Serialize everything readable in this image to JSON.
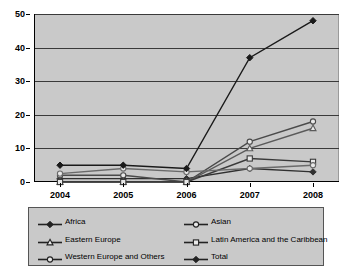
{
  "chart_data": {
    "type": "line",
    "title": "",
    "subtitle": "",
    "xlabel": "",
    "ylabel": "",
    "categories": [
      "2004",
      "2005",
      "2006",
      "2007",
      "2008"
    ],
    "x": [
      2004,
      2005,
      2006,
      2007,
      2008
    ],
    "ylim": [
      0,
      50
    ],
    "yticks": [
      0,
      10,
      20,
      30,
      40,
      50
    ],
    "grid": true,
    "legend_position": "bottom",
    "series": [
      {
        "name": "Africa",
        "marker": "filled-diamond",
        "color": "#303030",
        "values": [
          1,
          1,
          1,
          4,
          3
        ]
      },
      {
        "name": "Asian",
        "marker": "open-circle",
        "color": "#4a4a4a",
        "values": [
          2,
          2,
          0,
          12,
          18
        ]
      },
      {
        "name": "Eastern Europe",
        "marker": "open-triangle",
        "color": "#5a5a5a",
        "values": [
          0,
          0,
          0,
          10,
          16
        ]
      },
      {
        "name": "Latin America and the Caribbean",
        "marker": "open-square",
        "color": "#3a3a3a",
        "values": [
          0,
          0,
          0,
          7,
          6
        ]
      },
      {
        "name": "Western Europe and Others",
        "marker": "open-circle",
        "color": "#6a6a6a",
        "values": [
          2.5,
          4,
          3,
          4,
          5
        ]
      },
      {
        "name": "Total",
        "marker": "filled-diamond",
        "color": "#1a1a1a",
        "values": [
          5,
          5,
          4,
          37,
          48
        ]
      }
    ]
  },
  "legend": {
    "items": [
      {
        "label": "Africa",
        "marker": "filled-diamond"
      },
      {
        "label": "Asian",
        "marker": "open-circle"
      },
      {
        "label": "Eastern Europe",
        "marker": "open-triangle"
      },
      {
        "label": "Latin America and the Caribbean",
        "marker": "open-square"
      },
      {
        "label": "Western Europe and Others",
        "marker": "open-circle"
      },
      {
        "label": "Total",
        "marker": "filled-diamond"
      }
    ]
  },
  "colors": {
    "plot_background": "#c9c9c9",
    "page_background": "#ffffff",
    "gridline": "#3a3a3a",
    "axis": "#000000",
    "legend_background": "#c9c9c9",
    "legend_border": "#555555"
  }
}
